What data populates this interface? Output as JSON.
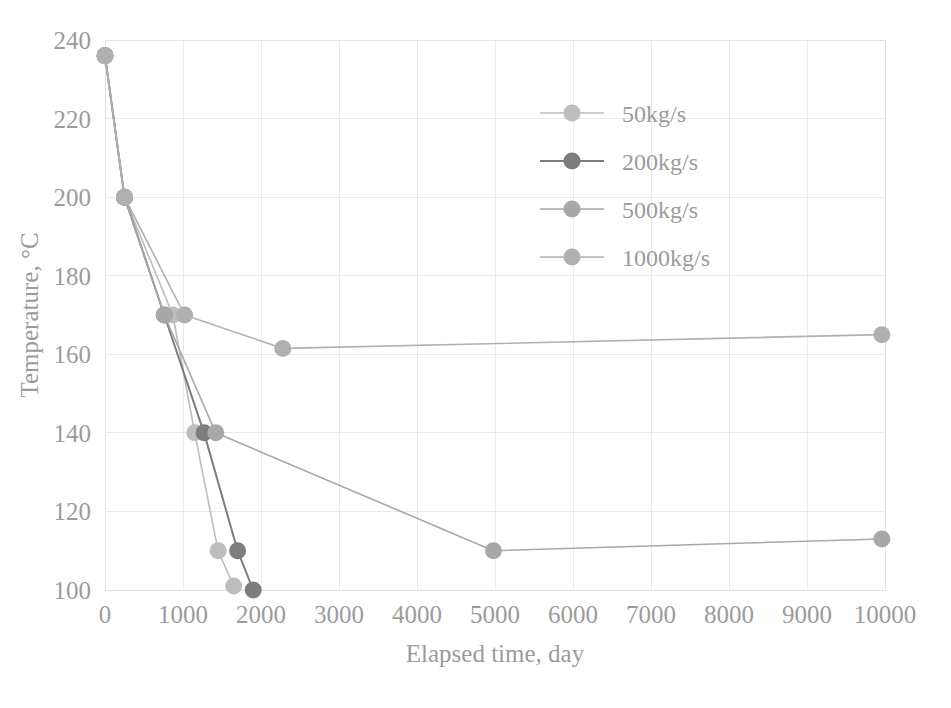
{
  "chart_data": {
    "type": "line",
    "title": "",
    "xlabel": "Elapsed time, day",
    "ylabel": "Temperature, °C",
    "xlim": [
      0,
      10000
    ],
    "ylim": [
      100,
      240
    ],
    "xticks": [
      0,
      1000,
      2000,
      3000,
      4000,
      5000,
      6000,
      7000,
      8000,
      9000,
      10000
    ],
    "xtick_labels": [
      "0",
      "1000",
      "2000",
      "3000",
      "4000",
      "5000",
      "6000",
      "7000",
      "8000",
      "9000",
      "10000"
    ],
    "yticks": [
      100,
      120,
      140,
      160,
      180,
      200,
      220,
      240
    ],
    "ytick_labels": [
      "100",
      "120",
      "140",
      "160",
      "180",
      "200",
      "220",
      "240"
    ],
    "grid": true,
    "legend_position": "upper right",
    "marker": "circle",
    "series": [
      {
        "name": "50kg/s",
        "color": "#bdbdbd",
        "points": [
          {
            "x": 0,
            "y": 236
          },
          {
            "x": 250,
            "y": 200
          },
          {
            "x": 870,
            "y": 170
          },
          {
            "x": 1150,
            "y": 140
          },
          {
            "x": 1450,
            "y": 110
          },
          {
            "x": 1650,
            "y": 101
          }
        ]
      },
      {
        "name": "200kg/s",
        "color": "#7d7d7d",
        "points": [
          {
            "x": 0,
            "y": 236
          },
          {
            "x": 250,
            "y": 200
          },
          {
            "x": 760,
            "y": 170
          },
          {
            "x": 1270,
            "y": 140
          },
          {
            "x": 1700,
            "y": 110
          },
          {
            "x": 1900,
            "y": 100
          }
        ]
      },
      {
        "name": "500kg/s",
        "color": "#a8a8a8",
        "points": [
          {
            "x": 0,
            "y": 236
          },
          {
            "x": 250,
            "y": 200
          },
          {
            "x": 760,
            "y": 170
          },
          {
            "x": 1420,
            "y": 140
          },
          {
            "x": 4980,
            "y": 110
          },
          {
            "x": 9960,
            "y": 113
          }
        ]
      },
      {
        "name": "1000kg/s",
        "color": "#b0b0b0",
        "points": [
          {
            "x": 0,
            "y": 236
          },
          {
            "x": 250,
            "y": 200
          },
          {
            "x": 1020,
            "y": 170
          },
          {
            "x": 2280,
            "y": 161.5
          },
          {
            "x": 9960,
            "y": 165
          }
        ]
      }
    ]
  },
  "legend": {
    "items": [
      {
        "label": "50kg/s",
        "color": "#bdbdbd"
      },
      {
        "label": "200kg/s",
        "color": "#7d7d7d"
      },
      {
        "label": "500kg/s",
        "color": "#a8a8a8"
      },
      {
        "label": "1000kg/s",
        "color": "#b0b0b0"
      }
    ]
  },
  "axes": {
    "x_title": "Elapsed time, day",
    "y_title": "Temperature, °C"
  },
  "style": {
    "background": "#ffffff",
    "grid_color": "#e9e9e9",
    "text_color": "#9b9b9b"
  }
}
